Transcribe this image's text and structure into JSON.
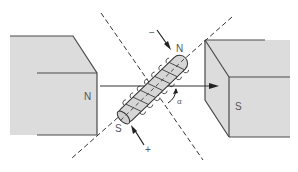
{
  "diagram": {
    "magnet_left": {
      "pole_label": "N"
    },
    "magnet_right": {
      "pole_label": "S"
    },
    "coil": {
      "end_top_label": "N",
      "end_bottom_label": "S",
      "terminal_top_label": "−",
      "terminal_bottom_label": "+"
    },
    "angle_label": "α",
    "colors": {
      "magnet_fill": "#dcdcdc",
      "magnet_edge": "#4a4a4a",
      "coil_fill": "#d6d6d6",
      "line": "#333333",
      "label": "#555555"
    }
  }
}
